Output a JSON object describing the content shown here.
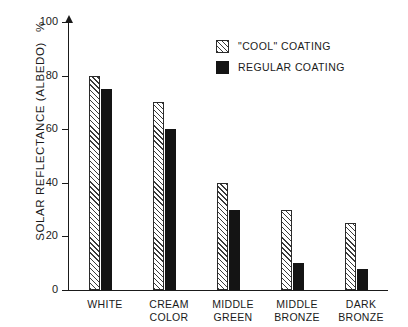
{
  "chart_data": {
    "type": "bar",
    "title": "",
    "xlabel": "",
    "ylabel": "SOLAR REFLECTANCE (ALBEDO)",
    "ylabel_unit": "%",
    "ylim": [
      0,
      100
    ],
    "yticks": [
      0,
      20,
      40,
      60,
      80,
      100
    ],
    "grid": false,
    "legend_position": "top-right",
    "categories": [
      "WHITE",
      "CREAM COLOR",
      "MIDDLE GREEN",
      "MIDDLE BRONZE",
      "DARK BRONZE"
    ],
    "category_lines": [
      [
        "WHITE"
      ],
      [
        "CREAM",
        "COLOR"
      ],
      [
        "MIDDLE",
        "GREEN"
      ],
      [
        "MIDDLE",
        "BRONZE"
      ],
      [
        "DARK",
        "BRONZE"
      ]
    ],
    "series": [
      {
        "name": "\"COOL\" COATING",
        "style": "hatched",
        "color": "#ffffff",
        "values": [
          80,
          70,
          40,
          30,
          25
        ]
      },
      {
        "name": "REGULAR COATING",
        "style": "solid",
        "color": "#141414",
        "values": [
          75,
          60,
          30,
          10,
          8
        ]
      }
    ]
  },
  "legend": {
    "items": [
      {
        "label": "\"COOL\" COATING",
        "swatch": "hatched-square-icon"
      },
      {
        "label": "REGULAR COATING",
        "swatch": "solid-square-icon"
      }
    ]
  },
  "axis": {
    "y_title": "SOLAR REFLECTANCE (ALBEDO)",
    "y_unit": "%",
    "tick_labels": [
      "0",
      "20",
      "40",
      "60",
      "80",
      "100"
    ]
  }
}
